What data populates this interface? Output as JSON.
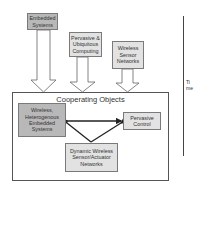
{
  "diagram": {
    "sources": [
      {
        "id": "embedded-systems",
        "lines": [
          "Embedded",
          "Systems"
        ]
      },
      {
        "id": "pervasive-ubiquitous",
        "lines": [
          "Pervasive &",
          "Ubiquitous",
          "Computing"
        ]
      },
      {
        "id": "wireless-sensor-networks",
        "lines": [
          "Wireless",
          "Sensor",
          "Networks"
        ]
      }
    ],
    "container": {
      "title": "Cooperating Objects",
      "nodes": [
        {
          "id": "wireless-heterogenous",
          "lines": [
            "Wireless,",
            "Heterogenous",
            "Embedded",
            "Systems"
          ]
        },
        {
          "id": "pervasive-control",
          "lines": [
            "Pervasive",
            "Control"
          ]
        },
        {
          "id": "dynamic-wsan",
          "lines": [
            "Dynamic Wireless",
            "Sensor/Actuator",
            "Networks"
          ]
        }
      ]
    },
    "time_axis": {
      "label_lines": [
        "Ti",
        "me"
      ]
    },
    "colors": {
      "source_embedded_fill": "#b8b8b8",
      "source_fill": "#e2e2e2",
      "node_dark_fill": "#b8b8b8",
      "node_light_fill": "#e2e2e2",
      "border": "#7a7a7a",
      "arrow": "#222222"
    }
  }
}
